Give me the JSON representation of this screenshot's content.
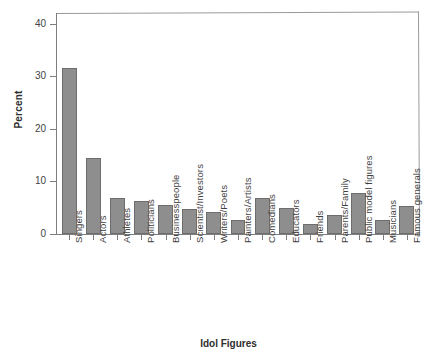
{
  "chart_data": {
    "type": "bar",
    "title": "",
    "xlabel": "Idol Figures",
    "ylabel": "Percent",
    "ylim": [
      0,
      42
    ],
    "yticks": [
      0,
      10,
      20,
      30,
      40
    ],
    "grid": false,
    "legend": false,
    "bar_color": "#8e8e8e",
    "bar_edge_color": "#6d6d6d",
    "categories": [
      "Singers",
      "Actors",
      "Athletes",
      "Politicians",
      "Businesspeople",
      "Scientist/Investors",
      "Writers/Poets",
      "Painters/Artists",
      "Comedians",
      "Educators",
      "Friends",
      "Parents/Family",
      "Public model figures",
      "Musicians",
      "Famous generals"
    ],
    "values": [
      31.6,
      14.5,
      6.8,
      6.2,
      5.5,
      4.8,
      4.1,
      2.6,
      6.9,
      5.0,
      1.9,
      3.7,
      7.7,
      2.6,
      5.4
    ]
  }
}
